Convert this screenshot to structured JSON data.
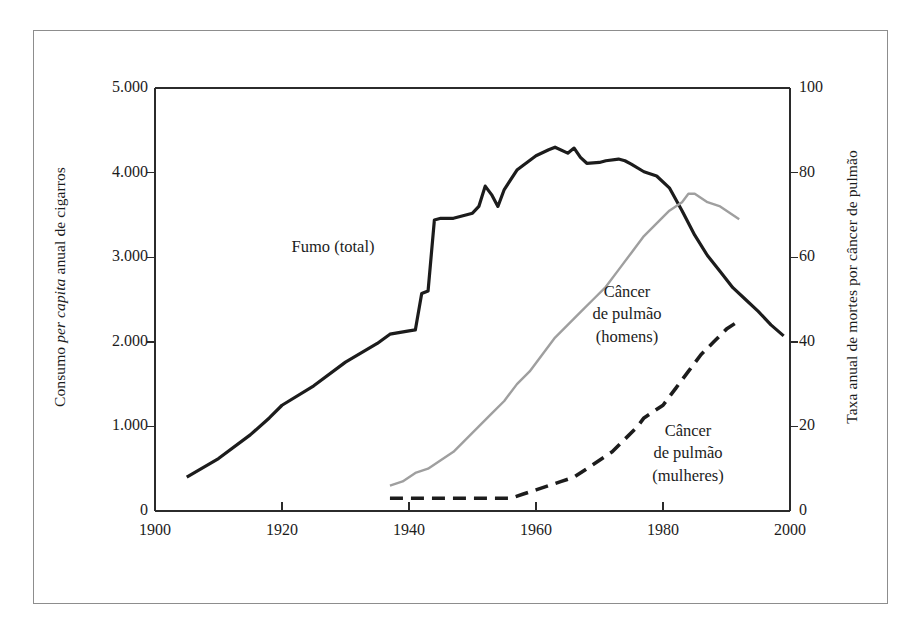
{
  "figure": {
    "background_color": "#ffffff",
    "frame_color": "#8d8d8d"
  },
  "axes": {
    "x": {
      "label": "",
      "ticks": [
        "1900",
        "1920",
        "1940",
        "1960",
        "1980",
        "2000"
      ],
      "tick_values": [
        1900,
        1920,
        1940,
        1960,
        1980,
        2000
      ],
      "range": [
        1900,
        2000
      ]
    },
    "y_left": {
      "label_prefix": "Consumo ",
      "label_italic": "per capita",
      "label_suffix": " anual de cigarros",
      "label_full": "Consumo per capita anual de cigarros",
      "ticks": [
        "0",
        "1.000",
        "2.000",
        "3.000",
        "4.000",
        "5.000"
      ],
      "tick_values": [
        0,
        1000,
        2000,
        3000,
        4000,
        5000
      ],
      "range": [
        0,
        5000
      ]
    },
    "y_right": {
      "label_full": "Taxa anual de mortes por câncer de pulmão",
      "ticks": [
        "0",
        "20",
        "40",
        "60",
        "80",
        "100"
      ],
      "tick_values": [
        0,
        20,
        40,
        60,
        80,
        100
      ],
      "range": [
        0,
        100
      ]
    }
  },
  "series_labels": {
    "smoking": {
      "lines": [
        "Fumo (total)"
      ]
    },
    "lung_men": {
      "lines": [
        "Câncer",
        "de pulmão",
        "(homens)"
      ]
    },
    "lung_women": {
      "lines": [
        "Câncer",
        "de pulmão",
        "(mulheres)"
      ]
    }
  },
  "chart_data": {
    "type": "line",
    "title": "",
    "xlabel": "",
    "ylabel": "Consumo per capita anual de cigarros",
    "ylabel_right": "Taxa anual de mortes por câncer de pulmão",
    "xlim": [
      1900,
      2000
    ],
    "ylim": [
      0,
      5000
    ],
    "ylim_right": [
      0,
      100
    ],
    "grid": false,
    "legend": "inline-annotations",
    "series": [
      {
        "name": "Fumo (total)",
        "axis": "left",
        "color": "#1c1c1c",
        "style": "solid",
        "width": 3.2,
        "x": [
          1905,
          1910,
          1915,
          1918,
          1920,
          1925,
          1930,
          1935,
          1937,
          1940,
          1941,
          1942,
          1943,
          1944,
          1945,
          1947,
          1950,
          1951,
          1952,
          1953,
          1954,
          1955,
          1957,
          1960,
          1962,
          1963,
          1965,
          1966,
          1967,
          1968,
          1970,
          1971,
          1973,
          1974,
          1975,
          1977,
          1979,
          1981,
          1983,
          1985,
          1987,
          1989,
          1991,
          1993,
          1995,
          1997,
          1999
        ],
        "y": [
          400,
          620,
          900,
          1100,
          1250,
          1480,
          1760,
          1980,
          2090,
          2130,
          2140,
          2570,
          2600,
          3440,
          3460,
          3460,
          3520,
          3600,
          3840,
          3740,
          3600,
          3800,
          4030,
          4200,
          4270,
          4300,
          4230,
          4290,
          4180,
          4110,
          4120,
          4140,
          4160,
          4140,
          4100,
          4010,
          3960,
          3820,
          3550,
          3260,
          3020,
          2830,
          2640,
          2500,
          2360,
          2200,
          2070
        ]
      },
      {
        "name": "Câncer de pulmão (homens)",
        "axis": "right",
        "color": "#9f9f9f",
        "style": "solid",
        "width": 2.4,
        "x": [
          1937,
          1939,
          1941,
          1943,
          1945,
          1947,
          1949,
          1951,
          1953,
          1955,
          1957,
          1959,
          1961,
          1963,
          1965,
          1967,
          1969,
          1971,
          1973,
          1975,
          1977,
          1979,
          1981,
          1983,
          1984,
          1985,
          1986,
          1987,
          1989,
          1991,
          1992
        ],
        "y": [
          6,
          7,
          9,
          10,
          12,
          14,
          17,
          20,
          23,
          26,
          30,
          33,
          37,
          41,
          44,
          47,
          50,
          53,
          57,
          61,
          65,
          68,
          71,
          73,
          75,
          75,
          74,
          73,
          72,
          70,
          69
        ]
      },
      {
        "name": "Câncer de pulmão (mulheres)",
        "axis": "right",
        "color": "#1c1c1c",
        "style": "dashed",
        "width": 3.6,
        "x": [
          1937,
          1942,
          1947,
          1952,
          1956,
          1958,
          1960,
          1962,
          1964,
          1966,
          1968,
          1970,
          1972,
          1974,
          1976,
          1977,
          1978,
          1980,
          1982,
          1984,
          1986,
          1988,
          1990,
          1992
        ],
        "y": [
          3,
          3,
          3,
          3,
          3,
          4,
          5,
          6,
          7,
          8,
          10,
          12,
          14,
          17,
          20,
          22,
          23,
          25,
          29,
          33,
          37,
          40,
          43,
          45
        ]
      }
    ]
  }
}
